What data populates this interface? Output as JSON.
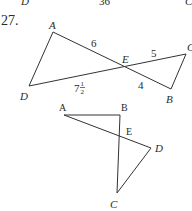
{
  "top_strip": {
    "left_label": "D",
    "middle_label": "36",
    "right_label": "C"
  },
  "problem": {
    "number": "27."
  },
  "figure1": {
    "points": {
      "A": {
        "label": "A",
        "x": 53,
        "y": 32
      },
      "B": {
        "label": "B",
        "x": 171,
        "y": 89
      },
      "C": {
        "label": "C",
        "x": 186,
        "y": 54
      },
      "D": {
        "label": "D",
        "x": 29,
        "y": 86
      },
      "E": {
        "label": "E",
        "x": 124,
        "y": 67
      }
    },
    "segment_labels": {
      "AE": "6",
      "EC": "5",
      "EB": "4",
      "DE_whole": "7",
      "DE_frac_num": "1",
      "DE_frac_den": "2"
    }
  },
  "figure2": {
    "points": {
      "A": {
        "label": "A",
        "x": 64,
        "y": 115
      },
      "B": {
        "label": "B",
        "x": 120,
        "y": 115
      },
      "C": {
        "label": "C",
        "x": 117,
        "y": 193
      },
      "D": {
        "label": "D",
        "x": 151,
        "y": 148
      },
      "E": {
        "label": "E",
        "x": 123,
        "y": 131
      }
    }
  },
  "colors": {
    "line": "#333333",
    "text": "#2a2a2a",
    "background": "#ffffff"
  }
}
